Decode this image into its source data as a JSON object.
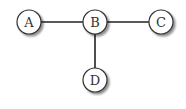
{
  "diagram": {
    "type": "graph",
    "nodes": [
      {
        "id": "A",
        "label": "A",
        "x": 29,
        "y": 22
      },
      {
        "id": "B",
        "label": "B",
        "x": 95,
        "y": 22
      },
      {
        "id": "C",
        "label": "C",
        "x": 161,
        "y": 22
      },
      {
        "id": "D",
        "label": "D",
        "x": 95,
        "y": 80
      }
    ],
    "edges": [
      {
        "from": "A",
        "to": "B"
      },
      {
        "from": "B",
        "to": "C"
      },
      {
        "from": "B",
        "to": "D"
      }
    ]
  }
}
